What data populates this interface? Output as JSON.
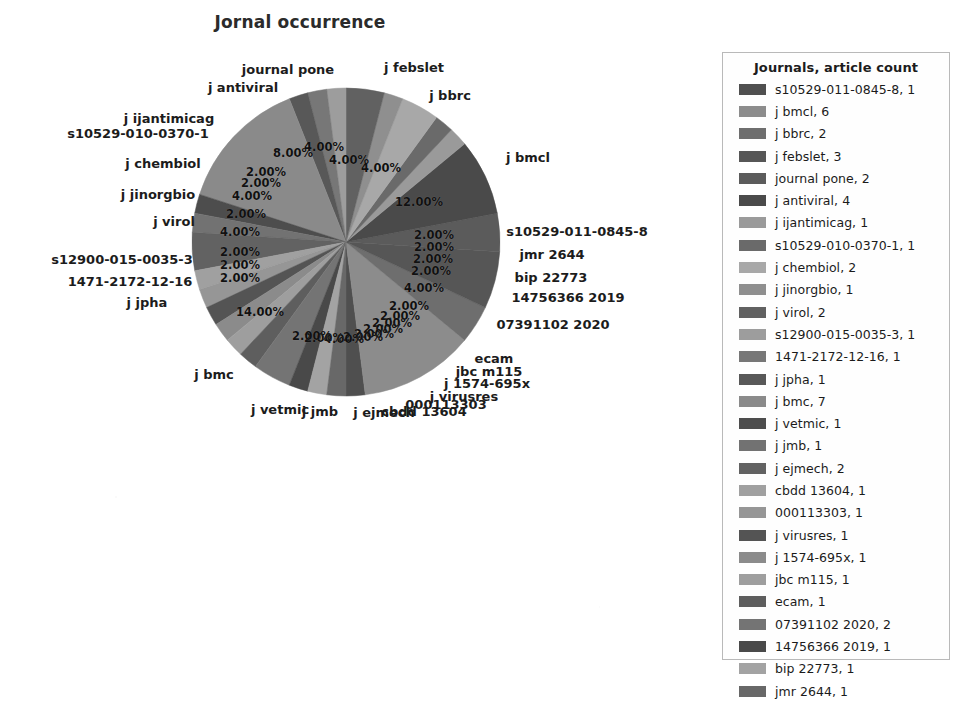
{
  "chart_data": {
    "type": "pie",
    "title": "Jornal occurrence",
    "xlabel": "",
    "ylabel": "",
    "total_articles": 50,
    "legend_position": "right",
    "legend_title": "Journals, article count",
    "value_format": "percent_2dp",
    "categories": [
      "s10529-011-0845-8",
      "j bmcl",
      "j bbrc",
      "j febslet",
      "journal pone",
      "j antiviral",
      "j ijantimicag",
      "s10529-010-0370-1",
      "j chembiol",
      "j jinorgbio",
      "j virol",
      "s12900-015-0035-3",
      "1471-2172-12-16",
      "j jpha",
      "j bmc",
      "j vetmic",
      "j jmb",
      "j ejmech",
      "cbdd 13604",
      "000113303",
      "j virusres",
      "j 1574-695x",
      "jbc m115",
      "ecam",
      "07391102 2020",
      "14756366 2019",
      "bip 22773",
      "jmr 2644"
    ],
    "values": [
      1,
      6,
      2,
      3,
      2,
      4,
      1,
      1,
      2,
      1,
      2,
      1,
      1,
      1,
      7,
      1,
      1,
      2,
      1,
      1,
      1,
      1,
      1,
      1,
      2,
      1,
      1,
      1
    ],
    "percents": [
      2.0,
      12.0,
      4.0,
      6.0,
      4.0,
      8.0,
      2.0,
      2.0,
      4.0,
      2.0,
      4.0,
      2.0,
      2.0,
      2.0,
      14.0,
      2.0,
      2.0,
      4.0,
      2.0,
      2.0,
      2.0,
      2.0,
      2.0,
      2.0,
      4.0,
      2.0,
      2.0,
      2.0
    ],
    "colors": [
      "#4f4f4f",
      "#8c8c8c",
      "#6e6e6e",
      "#565656",
      "#5b5b5b",
      "#4a4a4a",
      "#9a9a9a",
      "#6a6a6a",
      "#a8a8a8",
      "#8f8f8f",
      "#616161",
      "#9d9d9d",
      "#777777",
      "#585858",
      "#8a8a8a",
      "#4d4d4d",
      "#727272",
      "#626262",
      "#a0a0a0",
      "#969696",
      "#545454",
      "#8b8b8b",
      "#9e9e9e",
      "#5e5e5e",
      "#747474",
      "#494949",
      "#a3a3a3",
      "#686868"
    ],
    "slices": [
      {
        "label": "j febslet",
        "percent": "4.00%",
        "px": 349,
        "py": 160,
        "lx": 414,
        "ly": 67
      },
      {
        "label": "j bbrc",
        "percent": "4.00%",
        "px": 381,
        "py": 168,
        "lx": 450,
        "ly": 95
      },
      {
        "label": "j bmcl",
        "percent": "12.00%",
        "px": 419,
        "py": 202,
        "lx": 528,
        "ly": 157
      },
      {
        "label": "s10529-011-0845-8",
        "percent": "2.00%",
        "px": 434,
        "py": 235,
        "lx": 577,
        "ly": 231
      },
      {
        "label": "jmr 2644",
        "percent": "2.00%",
        "px": 434,
        "py": 247,
        "lx": 552,
        "ly": 254
      },
      {
        "label": "bip 22773",
        "percent": "2.00%",
        "px": 433,
        "py": 259,
        "lx": 551,
        "ly": 277
      },
      {
        "label": "14756366 2019",
        "percent": "2.00%",
        "px": 431,
        "py": 271,
        "lx": 568,
        "ly": 297
      },
      {
        "label": "07391102 2020",
        "percent": "4.00%",
        "px": 424,
        "py": 288,
        "lx": 553,
        "ly": 324
      },
      {
        "label": "ecam",
        "percent": "2.00%",
        "px": 409,
        "py": 306,
        "lx": 494,
        "ly": 358
      },
      {
        "label": "jbc m115",
        "percent": "2.00%",
        "px": 400,
        "py": 316,
        "lx": 489,
        "ly": 371
      },
      {
        "label": "j 1574-695x",
        "percent": "2.00%",
        "px": 392,
        "py": 323,
        "lx": 487,
        "ly": 383
      },
      {
        "label": "j virusres",
        "percent": "2.00%",
        "px": 383,
        "py": 329,
        "lx": 464,
        "ly": 396
      },
      {
        "label": "000113303",
        "percent": "2.00%",
        "px": 374,
        "py": 334,
        "lx": 446,
        "ly": 404
      },
      {
        "label": "cbdd 13604",
        "percent": "2.00%",
        "px": 363,
        "py": 337,
        "lx": 424,
        "ly": 411
      },
      {
        "label": "j ejmech",
        "percent": "4.00%",
        "px": 344,
        "py": 339,
        "lx": 384,
        "ly": 412
      },
      {
        "label": "j jmb",
        "percent": "2.00%",
        "px": 324,
        "py": 338,
        "lx": 320,
        "ly": 411
      },
      {
        "label": "j vetmic",
        "percent": "2.00%",
        "px": 312,
        "py": 336,
        "lx": 280,
        "ly": 409
      },
      {
        "label": "j bmc",
        "percent": "14.00%",
        "px": 260,
        "py": 312,
        "lx": 214,
        "ly": 374
      },
      {
        "label": "j jpha",
        "percent": "2.00%",
        "px": 240,
        "py": 278,
        "lx": 147,
        "ly": 302
      },
      {
        "label": "1471-2172-12-16",
        "percent": "2.00%",
        "px": 240,
        "py": 265,
        "lx": 130,
        "ly": 281
      },
      {
        "label": "s12900-015-0035-3",
        "percent": "2.00%",
        "px": 240,
        "py": 252,
        "lx": 122,
        "ly": 259
      },
      {
        "label": "j virol",
        "percent": "4.00%",
        "px": 240,
        "py": 232,
        "lx": 174,
        "ly": 221
      },
      {
        "label": "j jinorgbio",
        "percent": "2.00%",
        "px": 246,
        "py": 214,
        "lx": 158,
        "ly": 194
      },
      {
        "label": "j chembiol",
        "percent": "4.00%",
        "px": 252,
        "py": 196,
        "lx": 163,
        "ly": 163
      },
      {
        "label": "s10529-010-0370-1",
        "percent": "2.00%",
        "px": 261,
        "py": 183,
        "lx": 138,
        "ly": 133
      },
      {
        "label": "j ijantimicag",
        "percent": "2.00%",
        "px": 266,
        "py": 172,
        "lx": 169,
        "ly": 118
      },
      {
        "label": "j antiviral",
        "percent": "8.00%",
        "px": 293,
        "py": 153,
        "lx": 243,
        "ly": 87
      },
      {
        "label": "journal pone",
        "percent": "4.00%",
        "px": 324,
        "py": 147,
        "lx": 288,
        "ly": 69
      }
    ]
  },
  "legend": {
    "title": "Journals, article count",
    "entries": [
      {
        "label": "s10529-011-0845-8, 1",
        "color": "#4f4f4f"
      },
      {
        "label": "j bmcl, 6",
        "color": "#8c8c8c"
      },
      {
        "label": "j bbrc, 2",
        "color": "#6e6e6e"
      },
      {
        "label": "j febslet, 3",
        "color": "#565656"
      },
      {
        "label": "journal pone, 2",
        "color": "#5b5b5b"
      },
      {
        "label": "j antiviral, 4",
        "color": "#4a4a4a"
      },
      {
        "label": "j ijantimicag, 1",
        "color": "#9a9a9a"
      },
      {
        "label": "s10529-010-0370-1, 1",
        "color": "#6a6a6a"
      },
      {
        "label": "j chembiol, 2",
        "color": "#a8a8a8"
      },
      {
        "label": "j jinorgbio, 1",
        "color": "#8f8f8f"
      },
      {
        "label": "j virol, 2",
        "color": "#616161"
      },
      {
        "label": "s12900-015-0035-3, 1",
        "color": "#9d9d9d"
      },
      {
        "label": "1471-2172-12-16, 1",
        "color": "#777777"
      },
      {
        "label": "j jpha, 1",
        "color": "#585858"
      },
      {
        "label": "j bmc, 7",
        "color": "#8a8a8a"
      },
      {
        "label": "j vetmic, 1",
        "color": "#4d4d4d"
      },
      {
        "label": "j jmb, 1",
        "color": "#727272"
      },
      {
        "label": "j ejmech, 2",
        "color": "#626262"
      },
      {
        "label": "cbdd 13604, 1",
        "color": "#a0a0a0"
      },
      {
        "label": "000113303, 1",
        "color": "#969696"
      },
      {
        "label": "j virusres, 1",
        "color": "#545454"
      },
      {
        "label": "j 1574-695x, 1",
        "color": "#8b8b8b"
      },
      {
        "label": "jbc m115, 1",
        "color": "#9e9e9e"
      },
      {
        "label": "ecam, 1",
        "color": "#5e5e5e"
      },
      {
        "label": "07391102 2020, 2",
        "color": "#747474"
      },
      {
        "label": "14756366 2019, 1",
        "color": "#494949"
      },
      {
        "label": "bip 22773, 1",
        "color": "#a3a3a3"
      },
      {
        "label": "jmr 2644, 1",
        "color": "#686868"
      }
    ]
  }
}
